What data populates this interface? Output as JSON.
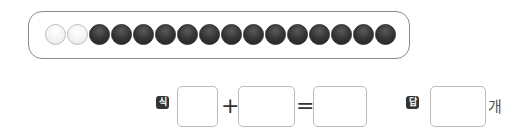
{
  "counters": {
    "white_count": 2,
    "black_count": 14,
    "beads": [
      "white",
      "white",
      "black",
      "black",
      "black",
      "black",
      "black",
      "black",
      "black",
      "black",
      "black",
      "black",
      "black",
      "black",
      "black",
      "black"
    ]
  },
  "equation": {
    "expression_label": "식",
    "plus": "+",
    "equals": "=",
    "answer_label": "답",
    "unit": "개",
    "input1_value": "",
    "input2_value": "",
    "result_value": "",
    "answer_value": ""
  }
}
